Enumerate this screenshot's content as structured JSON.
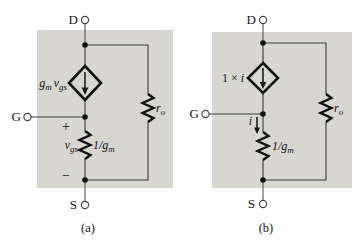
{
  "figure": {
    "type": "circuit-diagram",
    "colors": {
      "panel_fill": "#d7d6d1",
      "wire": "#3a3a3a",
      "component": "#111111",
      "background": "#ffffff"
    }
  },
  "circuit_a": {
    "caption": "(a)",
    "terminal_d": "D",
    "terminal_g": "G",
    "terminal_s": "S",
    "plus": "+",
    "minus": "−",
    "source_label": {
      "p1": "g",
      "p2": "m",
      "p3": "v",
      "p4": "gs"
    },
    "vgs_label": {
      "p1": "v",
      "p2": "gs"
    },
    "rgm_label": {
      "p1": "1/g",
      "p2": "m"
    },
    "ro_label": {
      "p1": "r",
      "p2": "o"
    }
  },
  "circuit_b": {
    "caption": "(b)",
    "terminal_d": "D",
    "terminal_g": "G",
    "terminal_s": "S",
    "source_label": {
      "p1": "1 ×",
      "p2": "i"
    },
    "branch_current_label": "i",
    "rgm_label": {
      "p1": "1/g",
      "p2": "m"
    },
    "ro_label": {
      "p1": "r",
      "p2": "o"
    }
  }
}
